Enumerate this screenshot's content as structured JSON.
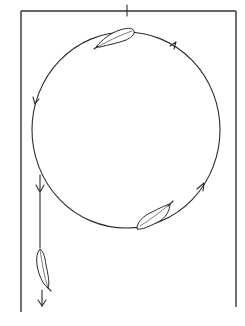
{
  "diagram": {
    "title": "Feather circling inside a rectangular frame then falling",
    "colors": {
      "line": "#2a2a2a",
      "frame": "#333333",
      "background": "#ffffff"
    },
    "frame": {
      "left": 21,
      "top": 11,
      "right": 236,
      "left_bottom": 312,
      "right_bottom": 307
    },
    "top_tick": {
      "x": 127,
      "y1": 7,
      "y2": 16
    },
    "circle": {
      "cx": 126,
      "cy": 130,
      "rx": 94,
      "ry": 98
    },
    "arrows": [
      {
        "name": "arrow-upper-right",
        "direction": "counterclockwise"
      },
      {
        "name": "arrow-left",
        "direction": "down"
      },
      {
        "name": "arrow-lower-right",
        "direction": "up"
      },
      {
        "name": "arrow-drop",
        "direction": "down"
      },
      {
        "name": "arrow-bottom",
        "direction": "down"
      }
    ],
    "feathers": [
      {
        "name": "feather-top",
        "position": "top of circle"
      },
      {
        "name": "feather-bottom",
        "position": "bottom-right of circle"
      },
      {
        "name": "feather-falling",
        "position": "below circle on left, falling"
      }
    ]
  }
}
